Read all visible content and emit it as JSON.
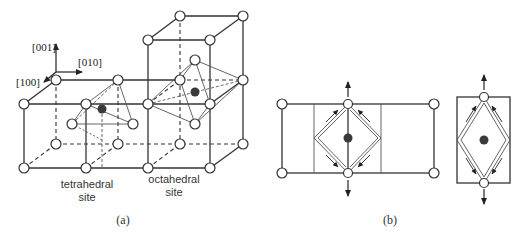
{
  "figure": {
    "panel_a": {
      "caption": "(a)",
      "axes": {
        "z_label": "[001]",
        "y_label": "[010]",
        "x_label": "[100]"
      },
      "site_labels": {
        "tetrahedral_line1": "tetrahedral",
        "tetrahedral_line2": "site",
        "octahedral_line1": "octahedral",
        "octahedral_line2": "site"
      }
    },
    "panel_b": {
      "caption": "(b)"
    },
    "colors": {
      "line": "#333333",
      "thin_line": "#555555",
      "atom_fill": "#ffffff",
      "interstitial_fill": "#3a3a3a"
    }
  }
}
